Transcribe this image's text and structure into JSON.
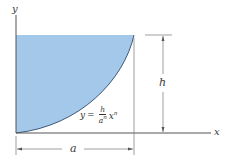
{
  "diagram": {
    "type": "area-under-curve",
    "colors": {
      "fill": "#a3c8ea",
      "axes": "#555555",
      "curve": "#2f4a6a",
      "dimension": "#666666"
    },
    "axes": {
      "x_label": "x",
      "y_label": "y"
    },
    "dimensions": {
      "width_label": "a",
      "height_label": "h"
    },
    "equation": {
      "lhs": "y",
      "equals": "=",
      "numerator": "h",
      "denominator": "a",
      "denominator_exp": "n",
      "variable": "x",
      "variable_exp": "n"
    }
  }
}
